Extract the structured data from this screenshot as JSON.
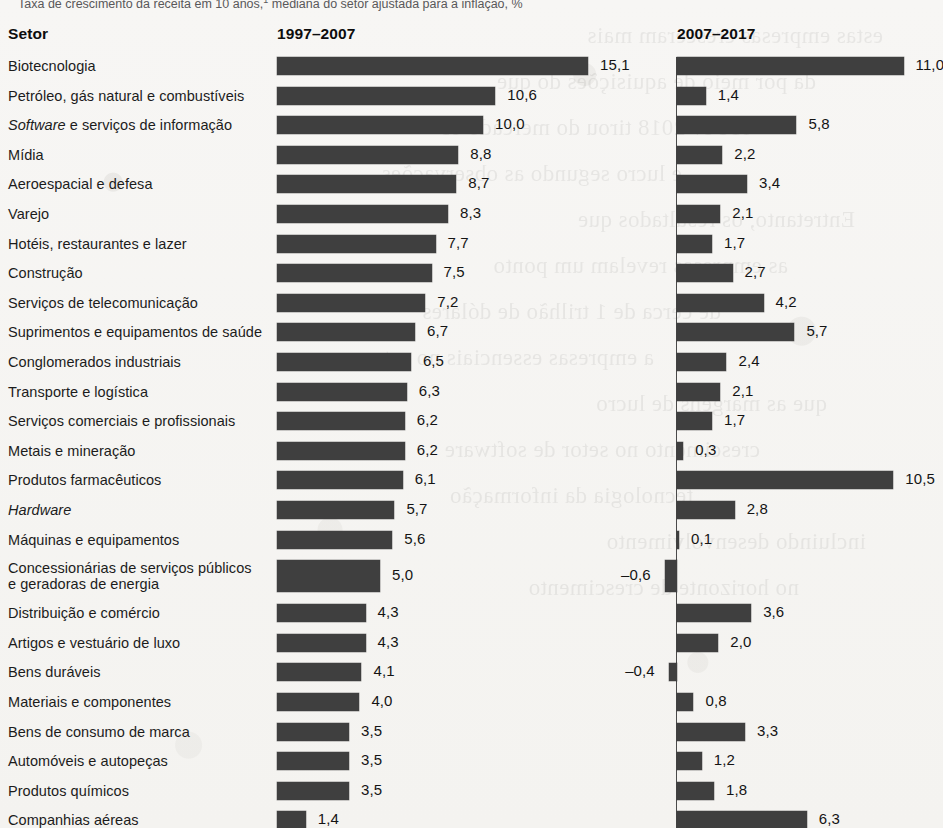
{
  "caption": {
    "text": "Taxa de crescimento da receita em 10 anos,",
    "footnote_marker": "1",
    "text_tail": " mediana do setor ajustada para a inflação, %"
  },
  "headers": {
    "sector": "Setor",
    "left_period": "1997–2007",
    "right_period": "2007–2017"
  },
  "style": {
    "bar_color": "#3f3f3f",
    "page_background": "#f7f6f4",
    "text_color": "#1c1c1c"
  },
  "chart_data": {
    "type": "bar",
    "xlabel": "",
    "ylabel": "Setor",
    "orientation": "horizontal",
    "grid": false,
    "legend_position": "top (column headers)",
    "categories": [
      "Biotecnologia",
      "Petróleo, gás natural e combustíveis",
      "Software e serviços de informação",
      "Mídia",
      "Aeroespacial e defesa",
      "Varejo",
      "Hotéis, restaurantes e lazer",
      "Construção",
      "Serviços de telecomunicação",
      "Suprimentos e equipamentos de saúde",
      "Conglomerados industriais",
      "Transporte e logística",
      "Serviços comerciais e profissionais",
      "Metais e mineração",
      "Produtos farmacêuticos",
      "Hardware",
      "Máquinas e equipamentos",
      "Concessionárias de serviços públicos e geradoras de energia",
      "Distribuição e comércio",
      "Artigos e vestuário de luxo",
      "Bens duráveis",
      "Materiais e componentes",
      "Bens de consumo de marca",
      "Automóveis e autopeças",
      "Produtos químicos",
      "Companhias aéreas"
    ],
    "series": [
      {
        "name": "1997–2007",
        "values": [
          15.1,
          10.6,
          10.0,
          8.8,
          8.7,
          8.3,
          7.7,
          7.5,
          7.2,
          6.7,
          6.5,
          6.3,
          6.2,
          6.2,
          6.1,
          5.7,
          5.6,
          5.0,
          4.3,
          4.3,
          4.1,
          4.0,
          3.5,
          3.5,
          3.5,
          1.4
        ],
        "labels": [
          "15,1",
          "10,6",
          "10,0",
          "8,8",
          "8,7",
          "8,3",
          "7,7",
          "7,5",
          "7,2",
          "6,7",
          "6,5",
          "6,3",
          "6,2",
          "6,2",
          "6,1",
          "5,7",
          "5,6",
          "5,0",
          "4,3",
          "4,3",
          "4,1",
          "4,0",
          "3,5",
          "3,5",
          "3,5",
          "1,4"
        ]
      },
      {
        "name": "2007–2017",
        "values": [
          11.0,
          1.4,
          5.8,
          2.2,
          3.4,
          2.1,
          1.7,
          2.7,
          4.2,
          5.7,
          2.4,
          2.1,
          1.7,
          0.3,
          10.5,
          2.8,
          0.1,
          -0.6,
          3.6,
          2.0,
          -0.4,
          0.8,
          3.3,
          1.2,
          1.8,
          6.3
        ],
        "labels": [
          "11,0",
          "1,4",
          "5,8",
          "2,2",
          "3,4",
          "2,1",
          "1,7",
          "2,7",
          "4,2",
          "5,7",
          "2,4",
          "2,1",
          "1,7",
          "0,3",
          "10,5",
          "2,8",
          "0,1",
          "–0,6",
          "3,6",
          "2,0",
          "–0,4",
          "0,8",
          "3,3",
          "1,2",
          "1,8",
          "6,3"
        ]
      }
    ]
  },
  "rows": [
    {
      "label": "Biotecnologia",
      "italic_prefix": "",
      "left": "15,1",
      "leftv": 15.1,
      "right": "11,0",
      "rightv": 11.0
    },
    {
      "label": "Petróleo, gás natural e combustíveis",
      "italic_prefix": "",
      "left": "10,6",
      "leftv": 10.6,
      "right": "1,4",
      "rightv": 1.4
    },
    {
      "label": " e serviços de informação",
      "italic_prefix": "Software",
      "left": "10,0",
      "leftv": 10.0,
      "right": "5,8",
      "rightv": 5.8
    },
    {
      "label": "Mídia",
      "italic_prefix": "",
      "left": "8,8",
      "leftv": 8.8,
      "right": "2,2",
      "rightv": 2.2
    },
    {
      "label": "Aeroespacial e defesa",
      "italic_prefix": "",
      "left": "8,7",
      "leftv": 8.7,
      "right": "3,4",
      "rightv": 3.4
    },
    {
      "label": "Varejo",
      "italic_prefix": "",
      "left": "8,3",
      "leftv": 8.3,
      "right": "2,1",
      "rightv": 2.1
    },
    {
      "label": "Hotéis, restaurantes e lazer",
      "italic_prefix": "",
      "left": "7,7",
      "leftv": 7.7,
      "right": "1,7",
      "rightv": 1.7
    },
    {
      "label": "Construção",
      "italic_prefix": "",
      "left": "7,5",
      "leftv": 7.5,
      "right": "2,7",
      "rightv": 2.7
    },
    {
      "label": "Serviços de telecomunicação",
      "italic_prefix": "",
      "left": "7,2",
      "leftv": 7.2,
      "right": "4,2",
      "rightv": 4.2
    },
    {
      "label": "Suprimentos e equipamentos de saúde",
      "italic_prefix": "",
      "left": "6,7",
      "leftv": 6.7,
      "right": "5,7",
      "rightv": 5.7
    },
    {
      "label": "Conglomerados industriais",
      "italic_prefix": "",
      "left": "6,5",
      "leftv": 6.5,
      "right": "2,4",
      "rightv": 2.4
    },
    {
      "label": "Transporte e logística",
      "italic_prefix": "",
      "left": "6,3",
      "leftv": 6.3,
      "right": "2,1",
      "rightv": 2.1
    },
    {
      "label": "Serviços comerciais e profissionais",
      "italic_prefix": "",
      "left": "6,2",
      "leftv": 6.2,
      "right": "1,7",
      "rightv": 1.7
    },
    {
      "label": "Metais e mineração",
      "italic_prefix": "",
      "left": "6,2",
      "leftv": 6.2,
      "right": "0,3",
      "rightv": 0.3
    },
    {
      "label": "Produtos farmacêuticos",
      "italic_prefix": "",
      "left": "6,1",
      "leftv": 6.1,
      "right": "10,5",
      "rightv": 10.5
    },
    {
      "label": "",
      "italic_prefix": "Hardware",
      "left": "5,7",
      "leftv": 5.7,
      "right": "2,8",
      "rightv": 2.8
    },
    {
      "label": "Máquinas e equipamentos",
      "italic_prefix": "",
      "left": "5,6",
      "leftv": 5.6,
      "right": "0,1",
      "rightv": 0.1
    },
    {
      "label": "Concessionárias de serviços públicos\ne geradoras de energia",
      "italic_prefix": "",
      "left": "5,0",
      "leftv": 5.0,
      "right": "–0,6",
      "rightv": -0.6,
      "tall": true
    },
    {
      "label": "Distribuição e comércio",
      "italic_prefix": "",
      "left": "4,3",
      "leftv": 4.3,
      "right": "3,6",
      "rightv": 3.6
    },
    {
      "label": "Artigos e vestuário de luxo",
      "italic_prefix": "",
      "left": "4,3",
      "leftv": 4.3,
      "right": "2,0",
      "rightv": 2.0
    },
    {
      "label": "Bens duráveis",
      "italic_prefix": "",
      "left": "4,1",
      "leftv": 4.1,
      "right": "–0,4",
      "rightv": -0.4
    },
    {
      "label": "Materiais e componentes",
      "italic_prefix": "",
      "left": "4,0",
      "leftv": 4.0,
      "right": "0,8",
      "rightv": 0.8
    },
    {
      "label": "Bens de consumo de marca",
      "italic_prefix": "",
      "left": "3,5",
      "leftv": 3.5,
      "right": "3,3",
      "rightv": 3.3
    },
    {
      "label": "Automóveis e autopeças",
      "italic_prefix": "",
      "left": "3,5",
      "leftv": 3.5,
      "right": "1,2",
      "rightv": 1.2
    },
    {
      "label": "Produtos químicos",
      "italic_prefix": "",
      "left": "3,5",
      "leftv": 3.5,
      "right": "1,8",
      "rightv": 1.8
    },
    {
      "label": "Companhias aéreas",
      "italic_prefix": "",
      "left": "1,4",
      "leftv": 1.4,
      "right": "6,3",
      "rightv": 6.3
    }
  ],
  "bleed_through_lines": [
    "estas empresas cresceram mais",
    "da por meio de aquisições do que",
    "A Fev 2018 tirou do mercado os",
    "e lucro segundo as observações",
    "Entretanto, os resultados que",
    "as empresas revelam um ponto",
    "de cerca de 1 trilhão de dólares",
    "a empresas essenciais no setor",
    "que as margens de lucro",
    "crescimento no setor de software",
    "tecnologia da informação",
    "incluindo desenvolvimento",
    "no horizonte de crescimento"
  ]
}
